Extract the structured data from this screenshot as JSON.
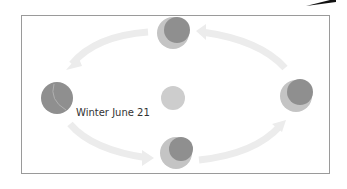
{
  "diagram": {
    "label": "Winter June 21",
    "colors": {
      "arrow": "#ececec",
      "planet_dark": "#8f8f8f",
      "planet_light": "#c4c4c4",
      "sun": "#cdcdcd",
      "frame": "#9a9a9a",
      "corner_wedge": "#111111"
    },
    "nodes": [
      {
        "id": "top",
        "phase": "crescent-lit-lower-left"
      },
      {
        "id": "left",
        "phase": "mostly-dark"
      },
      {
        "id": "right",
        "phase": "crescent-lit-lower-left"
      },
      {
        "id": "bottom",
        "phase": "crescent-lit-left"
      },
      {
        "id": "center",
        "phase": "sun"
      }
    ],
    "arrows": [
      {
        "from": "top",
        "to": "left"
      },
      {
        "from": "left",
        "to": "bottom"
      },
      {
        "from": "bottom",
        "to": "right"
      },
      {
        "from": "right",
        "to": "top"
      }
    ]
  }
}
